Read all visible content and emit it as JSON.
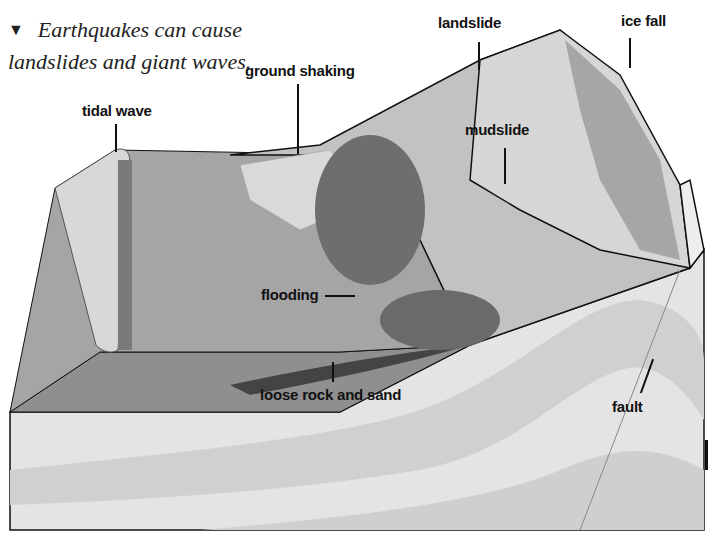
{
  "caption": {
    "partial_top_line": "We measure ...",
    "marker": "▼",
    "text": "Earthquakes can cause landslides and giant waves."
  },
  "labels": {
    "tidal_wave": "tidal wave",
    "ground_shaking": "ground shaking",
    "landslide": "landslide",
    "ice_fall": "ice fall",
    "mudslide": "mudslide",
    "flooding": "flooding",
    "loose_rock": "loose rock and sand",
    "fault": "fault"
  },
  "colors": {
    "label_text": "#111111",
    "sea_surface": "#9a9a9a",
    "sea_side": "#8e8e8e",
    "rock_light": "#e6e6e6",
    "rock_band": "#d2d2d2",
    "mountain": "#c9c9c9",
    "forest": "#6f6f6f",
    "fields": "#bdbdbd"
  }
}
